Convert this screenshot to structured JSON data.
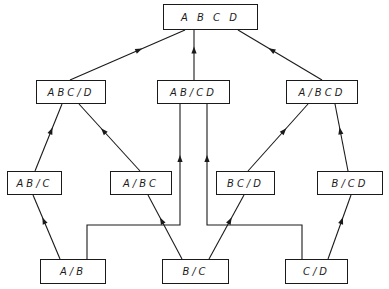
{
  "diagram": {
    "type": "lattice",
    "colors": {
      "line": "#1a1a1a",
      "background": "#ffffff"
    },
    "nodes": [
      {
        "id": "ABCD",
        "label": "A B C D",
        "x": 163,
        "y": 4,
        "w": 95,
        "h": 26
      },
      {
        "id": "ABC_D",
        "label": "ABC/D",
        "x": 36,
        "y": 80,
        "w": 70,
        "h": 24
      },
      {
        "id": "AB_CD",
        "label": "AB/CD",
        "x": 157,
        "y": 80,
        "w": 73,
        "h": 24
      },
      {
        "id": "A_BCD",
        "label": "A/BCD",
        "x": 286,
        "y": 80,
        "w": 72,
        "h": 24
      },
      {
        "id": "AB_C",
        "label": "AB/C",
        "x": 7,
        "y": 171,
        "w": 55,
        "h": 24
      },
      {
        "id": "A_BC",
        "label": "A/BC",
        "x": 110,
        "y": 171,
        "w": 62,
        "h": 24
      },
      {
        "id": "BC_D",
        "label": "BC/D",
        "x": 216,
        "y": 171,
        "w": 59,
        "h": 24
      },
      {
        "id": "B_CD",
        "label": "B/CD",
        "x": 317,
        "y": 171,
        "w": 66,
        "h": 24
      },
      {
        "id": "A_B",
        "label": "A/B",
        "x": 40,
        "y": 259,
        "w": 66,
        "h": 25
      },
      {
        "id": "B_C",
        "label": "B/C",
        "x": 162,
        "y": 259,
        "w": 67,
        "h": 25
      },
      {
        "id": "C_D",
        "label": "C/D",
        "x": 285,
        "y": 259,
        "w": 63,
        "h": 25
      }
    ],
    "edges": [
      {
        "from": "ABC_D",
        "to": "ABCD",
        "path": [
          [
            70,
            80
          ],
          [
            185,
            30
          ]
        ]
      },
      {
        "from": "AB_CD",
        "to": "ABCD",
        "path": [
          [
            194,
            80
          ],
          [
            194,
            30
          ]
        ]
      },
      {
        "from": "A_BCD",
        "to": "ABCD",
        "path": [
          [
            322,
            80
          ],
          [
            238,
            30
          ]
        ]
      },
      {
        "from": "AB_C",
        "to": "ABC_D",
        "path": [
          [
            35,
            171
          ],
          [
            62,
            104
          ]
        ]
      },
      {
        "from": "A_BC",
        "to": "ABC_D",
        "path": [
          [
            140,
            171
          ],
          [
            79,
            104
          ]
        ]
      },
      {
        "from": "BC_D",
        "to": "A_BCD",
        "path": [
          [
            248,
            171
          ],
          [
            308,
            104
          ]
        ]
      },
      {
        "from": "B_CD",
        "to": "A_BCD",
        "path": [
          [
            348,
            171
          ],
          [
            335,
            104
          ]
        ]
      },
      {
        "from": "A_B",
        "to": "AB_C",
        "path": [
          [
            60,
            259
          ],
          [
            33,
            195
          ]
        ]
      },
      {
        "from": "A_B",
        "to": "AB_CD",
        "path": [
          [
            87,
            259
          ],
          [
            87,
            225
          ],
          [
            180,
            225
          ],
          [
            180,
            104
          ]
        ]
      },
      {
        "from": "B_C",
        "to": "A_BC",
        "path": [
          [
            182,
            259
          ],
          [
            148,
            195
          ]
        ]
      },
      {
        "from": "B_C",
        "to": "BC_D",
        "path": [
          [
            209,
            259
          ],
          [
            244,
            195
          ]
        ]
      },
      {
        "from": "C_D",
        "to": "B_CD",
        "path": [
          [
            328,
            259
          ],
          [
            351,
            195
          ]
        ]
      },
      {
        "from": "C_D",
        "to": "AB_CD",
        "path": [
          [
            302,
            259
          ],
          [
            302,
            225
          ],
          [
            207,
            225
          ],
          [
            207,
            104
          ]
        ]
      }
    ]
  }
}
